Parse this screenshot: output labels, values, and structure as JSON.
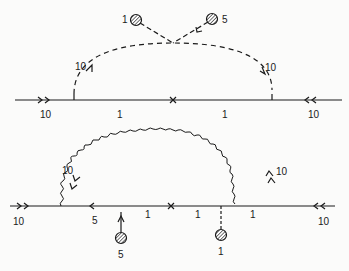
{
  "diagram_top": {
    "external_left_label": "10",
    "external_right_label": "10",
    "internal_left_label": "1",
    "internal_right_label": "1",
    "arc_left_label": "10",
    "arc_right_label": "10",
    "blob_left_label": "1",
    "blob_right_label": "5",
    "insertion_mark": "×"
  },
  "diagram_bottom": {
    "external_left_label": "10",
    "external_right_label": "10",
    "internal_label_a": "5",
    "internal_label_b": "1",
    "internal_label_c": "1",
    "internal_label_d": "1",
    "arc_left_label": "10",
    "arc_right_label": "10",
    "blob_left_label": "5",
    "blob_right_label": "1",
    "insertion_mark": "×"
  },
  "colors": {
    "ink": "#1a1a1a",
    "background": "#fbfbfa",
    "blob_fill": "#9a9a9a"
  }
}
